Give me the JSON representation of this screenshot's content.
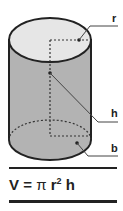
{
  "diagram": {
    "labels": {
      "radius": "r",
      "height": "h",
      "base": "b"
    },
    "formula": {
      "lhs": "V",
      "eq": "=",
      "pi": "π",
      "r": "r",
      "exp": "2",
      "h": "h"
    },
    "colors": {
      "side": "#b3b3b3",
      "top": "#e6e6e6",
      "outline": "#222222"
    }
  }
}
